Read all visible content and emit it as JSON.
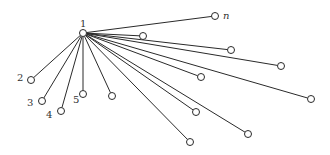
{
  "diagram": {
    "type": "star-graph",
    "hub": {
      "id": "1",
      "label": "1",
      "x": 83,
      "y": 33,
      "label_x": 80,
      "label_y": 27
    },
    "leaves": [
      {
        "label": "2",
        "x": 31,
        "y": 80,
        "label_x": 17,
        "label_y": 81
      },
      {
        "label": "3",
        "x": 42,
        "y": 101,
        "label_x": 27,
        "label_y": 106
      },
      {
        "label": "4",
        "x": 61,
        "y": 111,
        "label_x": 46,
        "label_y": 118
      },
      {
        "label": "5",
        "x": 83,
        "y": 94,
        "label_x": 73,
        "label_y": 103
      },
      {
        "label": "",
        "x": 112,
        "y": 96
      },
      {
        "label": "",
        "x": 190,
        "y": 142
      },
      {
        "label": "",
        "x": 248,
        "y": 134
      },
      {
        "label": "",
        "x": 196,
        "y": 112
      },
      {
        "label": "",
        "x": 311,
        "y": 99
      },
      {
        "label": "",
        "x": 201,
        "y": 77
      },
      {
        "label": "",
        "x": 281,
        "y": 66
      },
      {
        "label": "",
        "x": 231,
        "y": 50
      },
      {
        "label": "",
        "x": 143,
        "y": 36
      },
      {
        "label": "n",
        "x": 215,
        "y": 16,
        "label_x": 223,
        "label_y": 19,
        "italic": true
      }
    ]
  }
}
